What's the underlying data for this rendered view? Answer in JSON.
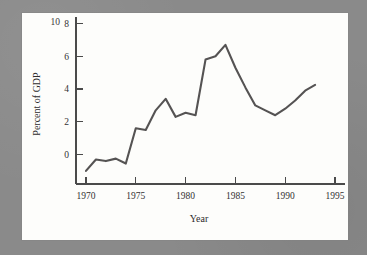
{
  "figure": {
    "background_color": "#8a8a8a",
    "plot_background_color": "#fdfdfb",
    "line_color": "#555353",
    "axis_color": "#4a4a4a",
    "text_color": "#333132",
    "clipped_top_label": "10"
  },
  "chart_data": {
    "type": "line",
    "title": "",
    "xlabel": "Year",
    "ylabel": "Percent of GDP",
    "xlim": [
      1969,
      1996
    ],
    "ylim": [
      -1.8,
      8.4
    ],
    "xticks": [
      1970,
      1975,
      1980,
      1985,
      1990,
      1995
    ],
    "xtick_labels": [
      "1970",
      "1975",
      "1980",
      "1985",
      "1990",
      "1995"
    ],
    "yticks": [
      0,
      2,
      4,
      6,
      8
    ],
    "ytick_labels": [
      "0",
      "2",
      "4",
      "6",
      "8"
    ],
    "grid": false,
    "legend": null,
    "x": [
      1970,
      1971,
      1972,
      1973,
      1974,
      1975,
      1976,
      1977,
      1978,
      1979,
      1980,
      1981,
      1982,
      1983,
      1984,
      1985,
      1986,
      1987,
      1988,
      1989,
      1990,
      1991,
      1992,
      1993
    ],
    "values": [
      -1.0,
      -0.3,
      -0.4,
      -0.25,
      -0.55,
      1.6,
      1.5,
      2.7,
      3.4,
      2.3,
      2.55,
      2.4,
      5.8,
      6.0,
      6.7,
      5.3,
      4.1,
      3.0,
      2.7,
      2.4,
      2.8,
      3.3,
      3.9,
      4.25
    ],
    "series": [
      {
        "name": "Percent of GDP",
        "values": [
          -1.0,
          -0.3,
          -0.4,
          -0.25,
          -0.55,
          1.6,
          1.5,
          2.7,
          3.4,
          2.3,
          2.55,
          2.4,
          5.8,
          6.0,
          6.7,
          5.3,
          4.1,
          3.0,
          2.7,
          2.4,
          2.8,
          3.3,
          3.9,
          4.25
        ]
      }
    ]
  }
}
